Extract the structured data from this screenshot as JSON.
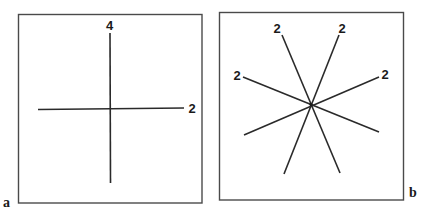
{
  "panels": [
    {
      "id": "a",
      "label": "a",
      "description": "Two perpendicular lines crossing (4-fold vertical axis, 2-fold horizontal axis)",
      "axes": [
        {
          "orientation": "vertical",
          "order_label": "4"
        },
        {
          "orientation": "horizontal",
          "order_label": "2"
        }
      ]
    },
    {
      "id": "b",
      "label": "b",
      "description": "Four lines crossing at a common center, each labelled as a 2-fold axis",
      "axes": [
        {
          "orientation": "steep-left",
          "order_label": "2"
        },
        {
          "orientation": "steep-right",
          "order_label": "2"
        },
        {
          "orientation": "shallow-left",
          "order_label": "2"
        },
        {
          "orientation": "shallow-right",
          "order_label": "2"
        }
      ]
    }
  ],
  "colors": {
    "line": "#2a2a2a",
    "frame": "#4a4a4a",
    "background": "#ffffff"
  }
}
